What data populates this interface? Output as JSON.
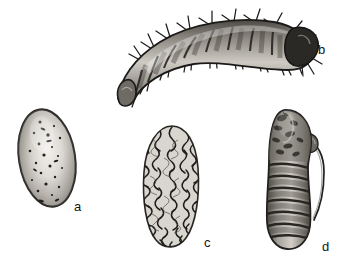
{
  "plate": {
    "title": "Insect life-stage illustration plate",
    "background_color": "#ffffff",
    "ink_color": "#1a1a1a",
    "style": "grayscale engraving / halftone scan",
    "figure_count": 4
  },
  "figures": [
    {
      "label": "a",
      "name": "egg",
      "description": "ovoid egg, tilted, speckled light surface with dark outline and shading at left and lower edges",
      "label_x": 74,
      "label_y": 200,
      "bounds": {
        "x": 18,
        "y": 108,
        "w": 62,
        "h": 104
      }
    },
    {
      "label": "b",
      "name": "larva",
      "description": "arched segmented larva with bristles, dark head capsule at right, tapering tail at lower left",
      "label_x": 318,
      "label_y": 43,
      "bounds": {
        "x": 104,
        "y": 10,
        "w": 212,
        "h": 94
      }
    },
    {
      "label": "c",
      "name": "cocoon",
      "description": "elongated oval cocoon with dense rough fibrous silk texture",
      "label_x": 204,
      "label_y": 236,
      "bounds": {
        "x": 140,
        "y": 126,
        "w": 66,
        "h": 122
      }
    },
    {
      "label": "d",
      "name": "pupa",
      "description": "elongated pupa with banded abdominal segments, rounded head at top and slender curved appendage along right side",
      "label_x": 322,
      "label_y": 240,
      "bounds": {
        "x": 262,
        "y": 110,
        "w": 62,
        "h": 140
      }
    }
  ]
}
